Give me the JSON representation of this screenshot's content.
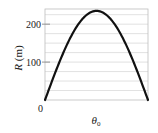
{
  "chart_data": {
    "type": "line",
    "title": "",
    "xlabel": "θ0",
    "xlabel_main": "θ",
    "xlabel_sub": "0",
    "ylabel": "R (m)",
    "ylabel_var": "R",
    "ylabel_unit": " (m)",
    "xlim": [
      0,
      90
    ],
    "ylim": [
      0,
      240
    ],
    "y_ticks": [
      0,
      100,
      200
    ],
    "y_tick_labels": [
      "0",
      "100",
      "200"
    ],
    "x_ticks": [],
    "grid": true,
    "grid_y": [
      25,
      50,
      75,
      100,
      125,
      150,
      175,
      200,
      225
    ],
    "legend": null,
    "series": [
      {
        "name": "R vs θ0",
        "x": [
          0,
          10,
          20,
          30,
          40,
          45,
          50,
          60,
          70,
          80,
          90
        ],
        "values": [
          0,
          80,
          151,
          203,
          231,
          235,
          231,
          203,
          151,
          80,
          0
        ]
      }
    ],
    "peak": {
      "x": 45,
      "y": 235
    },
    "colors": {
      "curve": "#111111",
      "grid": "#d9d9d9",
      "axis": "#888888"
    }
  }
}
